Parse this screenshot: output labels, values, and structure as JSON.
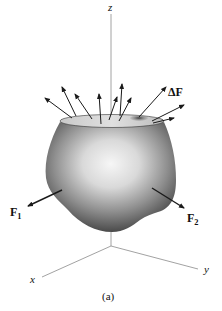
{
  "figure": {
    "caption": "(a)",
    "axes": {
      "z_label": "z",
      "x_label": "x",
      "y_label": "y"
    },
    "forces": {
      "delta_f": {
        "symbol": "Δ",
        "letter": "F"
      },
      "f1": {
        "letter": "F",
        "subscript": "1"
      },
      "f2": {
        "letter": "F",
        "subscript": "2"
      }
    },
    "colors": {
      "axis_line": "#8a8a8a",
      "arrow": "#1a1a1a",
      "body_dark": "#4a4a4a",
      "body_light": "#f2f2f2",
      "top_surface": "#d6d6d6",
      "patch": "#555555"
    },
    "top_arrow_count": 10
  }
}
